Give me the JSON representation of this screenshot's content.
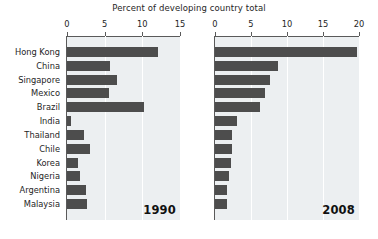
{
  "chart_data": {
    "type": "bar",
    "title": "Percent of developing country total",
    "orientation": "horizontal",
    "xlabel": "",
    "ylabel": "",
    "grid": true,
    "legend": "none",
    "categories": [
      "Hong Kong",
      "China",
      "Singapore",
      "Mexico",
      "Brazil",
      "India",
      "Thailand",
      "Chile",
      "Korea",
      "Nigeria",
      "Argentina",
      "Malaysia"
    ],
    "panels": [
      {
        "name": "1990",
        "annotation": "1990",
        "xlim": [
          0,
          15
        ],
        "xticks": [
          0,
          5,
          10,
          15
        ],
        "xticklabels": [
          "0",
          "5",
          "10",
          "15"
        ],
        "values": [
          12.1,
          5.7,
          6.7,
          5.6,
          10.2,
          0.5,
          2.3,
          3.0,
          1.5,
          1.7,
          2.5,
          2.7
        ]
      },
      {
        "name": "2008",
        "annotation": "2008",
        "xlim": [
          0,
          20
        ],
        "xticks": [
          0,
          5,
          10,
          15,
          20
        ],
        "xticklabels": [
          "0",
          "5",
          "10",
          "15",
          "20"
        ],
        "values": [
          19.7,
          8.7,
          7.6,
          7.0,
          6.2,
          3.1,
          2.3,
          2.4,
          2.2,
          2.0,
          1.7,
          1.6
        ]
      }
    ],
    "colors": {
      "bar": "#4d4d4d",
      "panel_background": "#eceff1",
      "gridline": "#ffffff",
      "axis": "#5a5a5a",
      "text": "#262626",
      "figure_background": "#ffffff"
    }
  }
}
